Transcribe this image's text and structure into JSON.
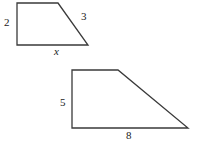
{
  "figure": {
    "stroke_color": "#3a3a3a",
    "background_color": "#ffffff",
    "stroke_width": 1.3,
    "shapes": [
      {
        "name": "trapezoid-small",
        "points": "17,3 58,3 88,45 17,45",
        "labels": {
          "left_side": "2",
          "slant_side": "3",
          "bottom_side": "x"
        }
      },
      {
        "name": "trapezoid-large",
        "points": "72,70 118,70 188,128 72,128",
        "labels": {
          "left_side": "5",
          "bottom_side": "8"
        }
      }
    ]
  },
  "labels": {
    "s1_left": "2",
    "s1_diag": "3",
    "s1_base": "x",
    "s2_left": "5",
    "s2_base": "8"
  }
}
